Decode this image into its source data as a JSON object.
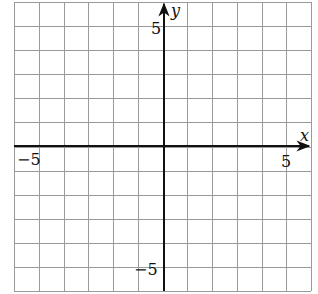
{
  "chart_data": {
    "type": "scatter",
    "title": "",
    "xlabel": "x",
    "ylabel": "y",
    "xlim": [
      -6,
      6
    ],
    "ylim": [
      -6,
      6
    ],
    "grid": true,
    "grid_step": 1,
    "x_tick_labels": [
      {
        "value": -5,
        "label": "−5"
      },
      {
        "value": 5,
        "label": "5"
      }
    ],
    "y_tick_labels": [
      {
        "value": 5,
        "label": "5"
      },
      {
        "value": -5,
        "label": "−5"
      }
    ],
    "series": [],
    "legend": null
  },
  "labels": {
    "x_axis": "x",
    "y_axis": "y",
    "x_neg5": "−5",
    "x_pos5": "5",
    "y_pos5": "5",
    "y_neg5": "−5"
  },
  "colors": {
    "grid": "#9a9a9a",
    "axis": "#111111",
    "background": "#ffffff"
  }
}
